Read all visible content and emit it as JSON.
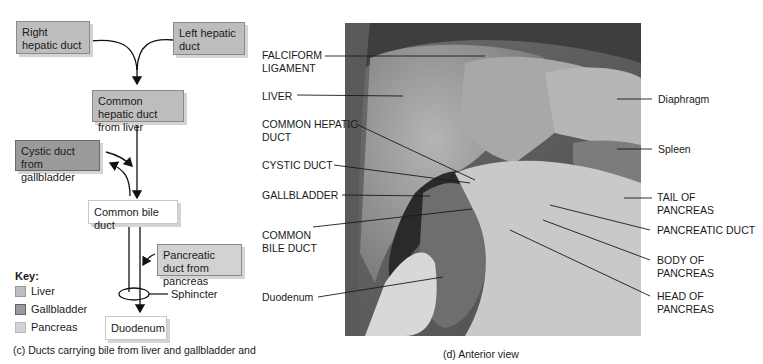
{
  "panel_c": {
    "boxes": {
      "right_hepatic": "Right hepatic duct",
      "left_hepatic": "Left hepatic duct",
      "common_hepatic": "Common hepatic duct from liver",
      "cystic": "Cystic duct from gallbladder",
      "common_bile": "Common bile duct",
      "pancreatic": "Pancreatic duct from pancreas",
      "duodenum": "Duodenum"
    },
    "sphincter_label": "Sphincter",
    "key": {
      "title": "Key:",
      "items": [
        {
          "label": "Liver",
          "color": "#bdbdbd"
        },
        {
          "label": "Gallbladder",
          "color": "#9a9a9a"
        },
        {
          "label": "Pancreas",
          "color": "#d2d2d2"
        }
      ]
    },
    "caption": "(c) Ducts carrying bile from liver and gallbladder and"
  },
  "panel_d": {
    "labels_left": {
      "falciform": "FALCIFORM\nLIGAMENT",
      "liver": "LIVER",
      "common_hepatic": "COMMON HEPATIC\nDUCT",
      "cystic": "CYSTIC DUCT",
      "gallbladder": "GALLBLADDER",
      "common_bile": "COMMON\nBILE DUCT",
      "duodenum": "Duodenum"
    },
    "labels_right": {
      "diaphragm": "Diaphragm",
      "spleen": "Spleen",
      "tail_pancreas": "TAIL OF\nPANCREAS",
      "pancreatic_duct": "PANCREATIC DUCT",
      "body_pancreas": "BODY OF\nPANCREAS",
      "head_pancreas": "HEAD OF\nPANCREAS"
    },
    "caption": "(d) Anterior view"
  }
}
